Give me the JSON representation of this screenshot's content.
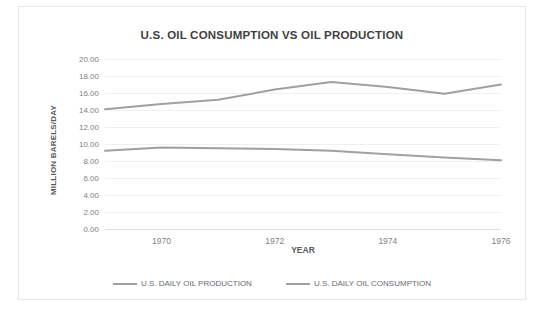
{
  "chart_data": {
    "type": "line",
    "title": "U.S. OIL CONSUMPTION VS OIL PRODUCTION",
    "xlabel": "YEAR",
    "ylabel": "MILLION BARELS/DAY",
    "x": [
      1969,
      1970,
      1971,
      1972,
      1973,
      1974,
      1975,
      1976
    ],
    "xlim": [
      1969,
      1976
    ],
    "ylim": [
      0,
      20
    ],
    "ytick_labels": [
      "20.00",
      "18.00",
      "16.00",
      "14.00",
      "12.00",
      "10.00",
      "8.00",
      "6.00",
      "4.00",
      "2.00",
      "0.00"
    ],
    "ytick_values": [
      20,
      18,
      16,
      14,
      12,
      10,
      8,
      6,
      4,
      2,
      0
    ],
    "xtick_labels": [
      "1970",
      "1972",
      "1974",
      "1976"
    ],
    "xtick_values": [
      1970,
      1972,
      1974,
      1976
    ],
    "grid": true,
    "legend_position": "bottom",
    "series": [
      {
        "name": "U.S. DAILY OIL PRODUCTION",
        "color": "#a0a0a0",
        "values": [
          9.2,
          9.6,
          9.5,
          9.4,
          9.2,
          8.8,
          8.4,
          8.1
        ]
      },
      {
        "name": "U.S. DAILY OIL CONSUMPTION",
        "color": "#a0a0a0",
        "values": [
          14.1,
          14.7,
          15.2,
          16.4,
          17.3,
          16.7,
          15.9,
          17.0
        ]
      }
    ]
  }
}
